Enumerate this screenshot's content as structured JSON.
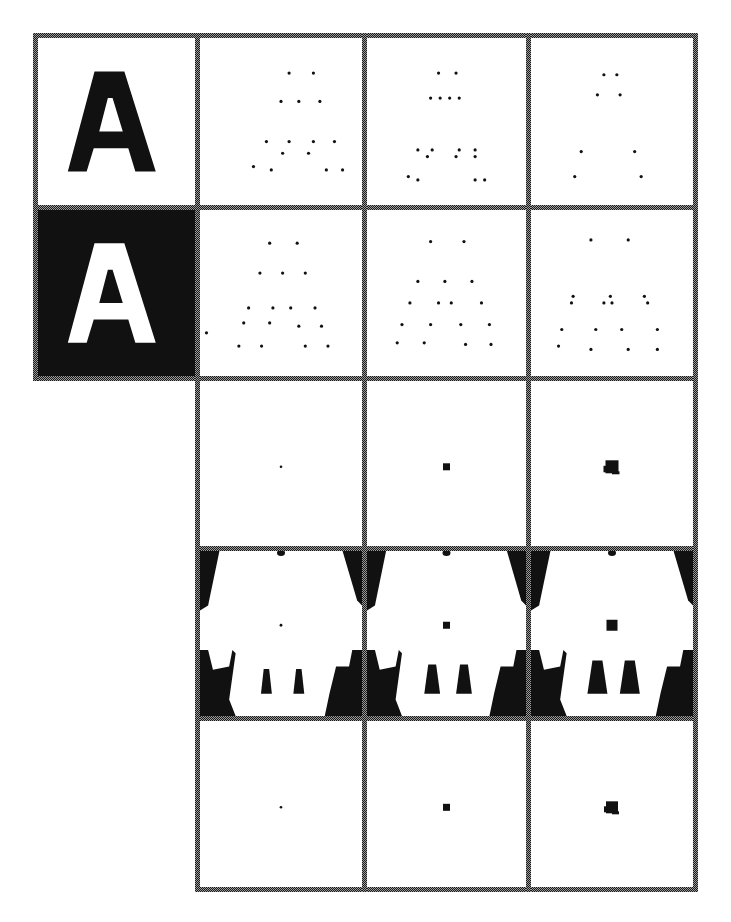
{
  "figure": {
    "background": "#ffffff",
    "border_color": "#1a1a1a",
    "border_light": "#9a9a9a",
    "ink": "#111111",
    "border_thickness": 5,
    "rows": [
      33,
      205,
      376,
      546,
      716,
      887
    ],
    "cols": [
      33,
      195,
      362,
      526,
      693
    ]
  },
  "cells": [
    {
      "id": "r0c0",
      "row": 0,
      "col": 0,
      "type": "glyph",
      "letter": "A",
      "inverted": false
    },
    {
      "id": "r0c1",
      "row": 0,
      "col": 1,
      "type": "dots",
      "points": [
        [
          0.55,
          0.21
        ],
        [
          0.7,
          0.21
        ],
        [
          0.5,
          0.38
        ],
        [
          0.61,
          0.38
        ],
        [
          0.74,
          0.38
        ],
        [
          0.41,
          0.62
        ],
        [
          0.55,
          0.62
        ],
        [
          0.7,
          0.62
        ],
        [
          0.83,
          0.62
        ],
        [
          0.51,
          0.69
        ],
        [
          0.67,
          0.69
        ],
        [
          0.33,
          0.77
        ],
        [
          0.44,
          0.79
        ],
        [
          0.78,
          0.79
        ],
        [
          0.88,
          0.79
        ]
      ]
    },
    {
      "id": "r0c2",
      "row": 0,
      "col": 2,
      "type": "dots",
      "points": [
        [
          0.45,
          0.21
        ],
        [
          0.56,
          0.21
        ],
        [
          0.4,
          0.36
        ],
        [
          0.46,
          0.36
        ],
        [
          0.52,
          0.36
        ],
        [
          0.58,
          0.36
        ],
        [
          0.32,
          0.67
        ],
        [
          0.41,
          0.67
        ],
        [
          0.38,
          0.71
        ],
        [
          0.58,
          0.67
        ],
        [
          0.56,
          0.71
        ],
        [
          0.68,
          0.67
        ],
        [
          0.68,
          0.71
        ],
        [
          0.26,
          0.83
        ],
        [
          0.32,
          0.85
        ],
        [
          0.68,
          0.85
        ],
        [
          0.74,
          0.85
        ]
      ]
    },
    {
      "id": "r0c3",
      "row": 0,
      "col": 3,
      "type": "dots",
      "points": [
        [
          0.45,
          0.22
        ],
        [
          0.53,
          0.22
        ],
        [
          0.41,
          0.34
        ],
        [
          0.55,
          0.34
        ],
        [
          0.31,
          0.68
        ],
        [
          0.64,
          0.68
        ],
        [
          0.27,
          0.83
        ],
        [
          0.68,
          0.83
        ]
      ]
    },
    {
      "id": "r1c0",
      "row": 1,
      "col": 0,
      "type": "glyph",
      "letter": "A",
      "inverted": true
    },
    {
      "id": "r1c1",
      "row": 1,
      "col": 1,
      "type": "dots",
      "points": [
        [
          0.43,
          0.2
        ],
        [
          0.6,
          0.2
        ],
        [
          0.37,
          0.38
        ],
        [
          0.51,
          0.38
        ],
        [
          0.65,
          0.38
        ],
        [
          0.3,
          0.59
        ],
        [
          0.45,
          0.59
        ],
        [
          0.56,
          0.59
        ],
        [
          0.71,
          0.59
        ],
        [
          0.27,
          0.68
        ],
        [
          0.43,
          0.68
        ],
        [
          0.61,
          0.7
        ],
        [
          0.75,
          0.7
        ],
        [
          0.04,
          0.74
        ],
        [
          0.24,
          0.82
        ],
        [
          0.38,
          0.82
        ],
        [
          0.65,
          0.82
        ],
        [
          0.79,
          0.82
        ]
      ]
    },
    {
      "id": "r1c2",
      "row": 1,
      "col": 2,
      "type": "dots",
      "points": [
        [
          0.4,
          0.19
        ],
        [
          0.61,
          0.19
        ],
        [
          0.32,
          0.43
        ],
        [
          0.49,
          0.43
        ],
        [
          0.66,
          0.43
        ],
        [
          0.27,
          0.56
        ],
        [
          0.45,
          0.56
        ],
        [
          0.53,
          0.56
        ],
        [
          0.72,
          0.56
        ],
        [
          0.22,
          0.69
        ],
        [
          0.4,
          0.69
        ],
        [
          0.59,
          0.69
        ],
        [
          0.77,
          0.69
        ],
        [
          0.19,
          0.8
        ],
        [
          0.36,
          0.8
        ],
        [
          0.62,
          0.81
        ],
        [
          0.78,
          0.81
        ]
      ]
    },
    {
      "id": "r1c3",
      "row": 1,
      "col": 3,
      "type": "dots",
      "points": [
        [
          0.37,
          0.18
        ],
        [
          0.6,
          0.18
        ],
        [
          0.26,
          0.52
        ],
        [
          0.49,
          0.52
        ],
        [
          0.7,
          0.52
        ],
        [
          0.25,
          0.56
        ],
        [
          0.45,
          0.56
        ],
        [
          0.5,
          0.56
        ],
        [
          0.72,
          0.56
        ],
        [
          0.19,
          0.72
        ],
        [
          0.4,
          0.72
        ],
        [
          0.56,
          0.72
        ],
        [
          0.78,
          0.72
        ],
        [
          0.17,
          0.82
        ],
        [
          0.37,
          0.84
        ],
        [
          0.6,
          0.84
        ],
        [
          0.78,
          0.84
        ]
      ]
    },
    {
      "id": "r2c1",
      "row": 2,
      "col": 1,
      "type": "center-blob",
      "size": 2,
      "jagged": false
    },
    {
      "id": "r2c2",
      "row": 2,
      "col": 2,
      "type": "center-blob",
      "size": 7,
      "jagged": false
    },
    {
      "id": "r2c3",
      "row": 2,
      "col": 3,
      "type": "center-blob",
      "size": 13,
      "jagged": true
    },
    {
      "id": "r3c1",
      "row": 3,
      "col": 1,
      "type": "eroded",
      "blob": 2,
      "leg_scale": 0.35
    },
    {
      "id": "r3c2",
      "row": 3,
      "col": 2,
      "type": "eroded",
      "blob": 7,
      "leg_scale": 0.7
    },
    {
      "id": "r3c3",
      "row": 3,
      "col": 3,
      "type": "eroded",
      "blob": 11,
      "leg_scale": 1.0
    },
    {
      "id": "r4c1",
      "row": 4,
      "col": 1,
      "type": "center-blob",
      "size": 2,
      "jagged": false
    },
    {
      "id": "r4c2",
      "row": 4,
      "col": 2,
      "type": "center-blob",
      "size": 7,
      "jagged": false
    },
    {
      "id": "r4c3",
      "row": 4,
      "col": 3,
      "type": "center-blob",
      "size": 12,
      "jagged": true
    }
  ]
}
